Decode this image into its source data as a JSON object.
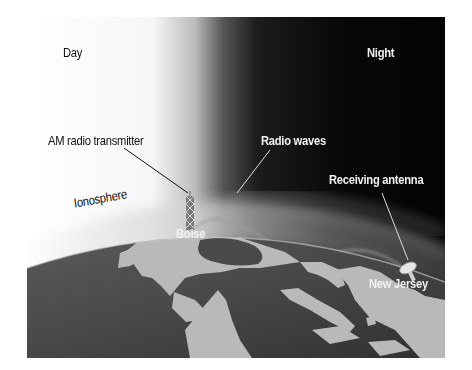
{
  "diagram": {
    "labels": {
      "day": "Day",
      "night": "Night",
      "transmitter": "AM radio transmitter",
      "radio_waves": "Radio waves",
      "receiving_antenna": "Receiving antenna",
      "ionosphere": "Ionosphere",
      "boise": "Boise",
      "new_jersey": "New Jersey"
    },
    "colors": {
      "day_sky": "#ffffff",
      "night_sky": "#050505",
      "ocean": "#4a4a4a",
      "land": "#b8b8b8",
      "ionosphere_glow": "#d8d8d8"
    }
  }
}
